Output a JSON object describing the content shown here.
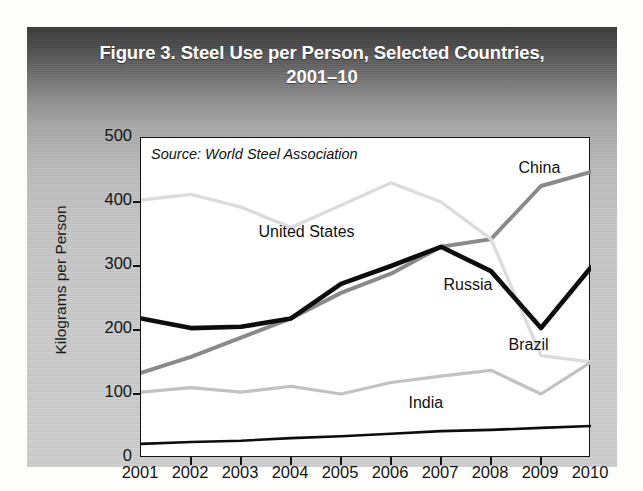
{
  "figure": {
    "title": "Figure 3. Steel Use per Person, Selected Countries, 2001–10",
    "title_line1": "Figure 3. Steel Use per Person, Selected Countries,",
    "title_line2": "2001–10",
    "source": "Source: World Steel Association"
  },
  "chart_data": {
    "type": "line",
    "title": "Figure 3. Steel Use per Person, Selected Countries, 2001–10",
    "xlabel": "",
    "ylabel": "Kilograms per Person",
    "xlim": [
      2001,
      2010
    ],
    "ylim": [
      0,
      500
    ],
    "yticks": [
      0,
      100,
      200,
      300,
      400,
      500
    ],
    "ytick_labels": [
      "0",
      "100",
      "200",
      "300",
      "400",
      "500"
    ],
    "x": [
      2001,
      2002,
      2003,
      2004,
      2005,
      2006,
      2007,
      2008,
      2009,
      2010
    ],
    "xtick_labels": [
      "2001",
      "2002",
      "2003",
      "2004",
      "2005",
      "2006",
      "2007",
      "2008",
      "2009",
      "2010"
    ],
    "grid": false,
    "legend": "inline-annotations",
    "annotation_note": "Source: World Steel Association",
    "series": [
      {
        "name": "China",
        "label": "China",
        "color": "#8a8a8a",
        "width": 4.0,
        "values": [
          133,
          158,
          188,
          218,
          258,
          288,
          330,
          342,
          425,
          447
        ]
      },
      {
        "name": "United States",
        "label": "United States",
        "color": "#dcdcdc",
        "width": 3.4,
        "values": [
          403,
          412,
          392,
          360,
          395,
          430,
          400,
          342,
          160,
          150
        ]
      },
      {
        "name": "Russia",
        "label": "Russia",
        "color": "#0d0d0d",
        "width": 4.6,
        "values": [
          218,
          203,
          205,
          218,
          272,
          300,
          330,
          292,
          203,
          298
        ]
      },
      {
        "name": "Brazil",
        "label": "Brazil",
        "color": "#c2c2c2",
        "width": 3.2,
        "values": [
          103,
          110,
          103,
          112,
          100,
          118,
          128,
          137,
          100,
          150
        ]
      },
      {
        "name": "India",
        "label": "India",
        "color": "#0d0d0d",
        "width": 2.6,
        "values": [
          22,
          25,
          27,
          31,
          34,
          38,
          42,
          44,
          47,
          50
        ]
      }
    ]
  },
  "annotations": [
    {
      "name": "china-label",
      "text": "China",
      "x": 2008.55,
      "y": 452
    },
    {
      "name": "united-states-label",
      "text": "United States",
      "x": 2003.35,
      "y": 352
    },
    {
      "name": "russia-label",
      "text": "Russia",
      "x": 2007.05,
      "y": 268
    },
    {
      "name": "brazil-label",
      "text": "Brazil",
      "x": 2008.35,
      "y": 175
    },
    {
      "name": "india-label",
      "text": "India",
      "x": 2006.35,
      "y": 85
    }
  ]
}
